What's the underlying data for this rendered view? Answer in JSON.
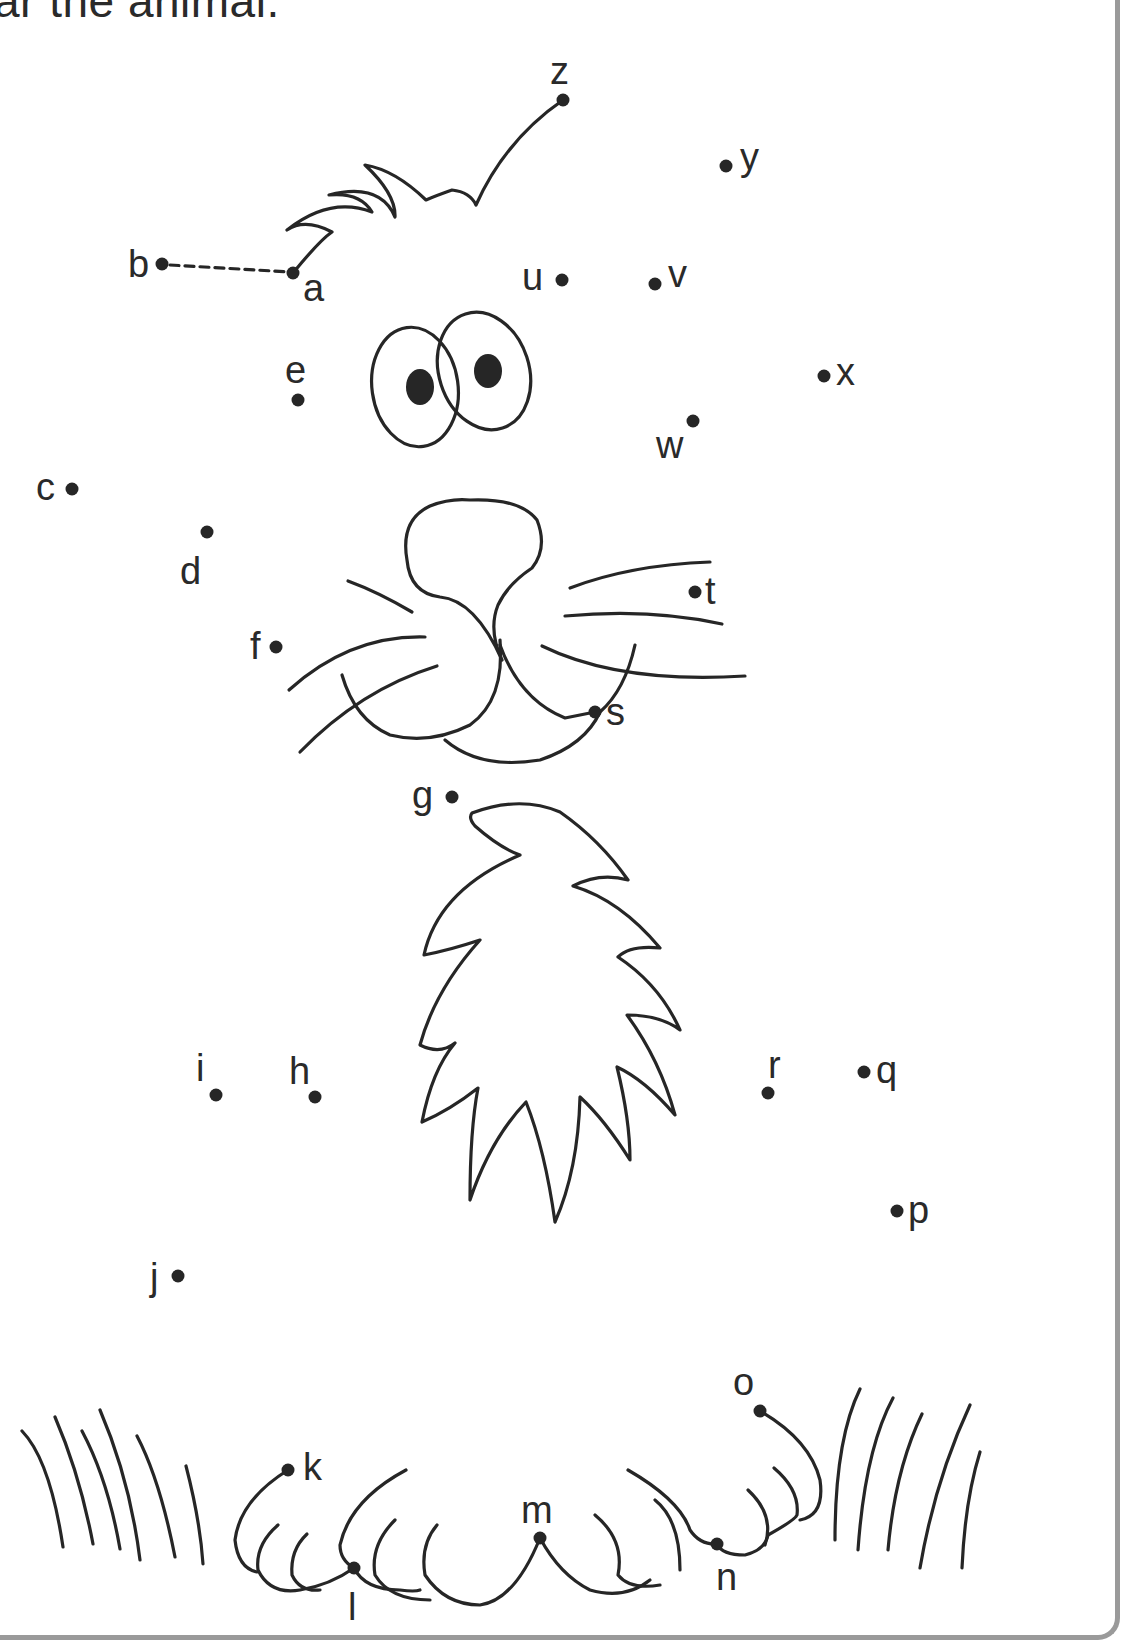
{
  "worksheet": {
    "title_partial": "ar the animal.",
    "instruction_visible": "ar the animal.",
    "sequence_start": "a",
    "sequence_end": "z",
    "guide_segment": {
      "from": "b",
      "to": "a",
      "style": "dashed"
    }
  },
  "dots": [
    {
      "label": "a",
      "x": 293,
      "y": 273
    },
    {
      "label": "b",
      "x": 162,
      "y": 264
    },
    {
      "label": "c",
      "x": 70,
      "y": 489
    },
    {
      "label": "d",
      "x": 207,
      "y": 532
    },
    {
      "label": "e",
      "x": 298,
      "y": 400
    },
    {
      "label": "f",
      "x": 276,
      "y": 647
    },
    {
      "label": "g",
      "x": 452,
      "y": 797
    },
    {
      "label": "h",
      "x": 315,
      "y": 1097
    },
    {
      "label": "i",
      "x": 216,
      "y": 1095
    },
    {
      "label": "j",
      "x": 178,
      "y": 1276
    },
    {
      "label": "k",
      "x": 288,
      "y": 1470
    },
    {
      "label": "l",
      "x": 354,
      "y": 1568
    },
    {
      "label": "m",
      "x": 540,
      "y": 1538
    },
    {
      "label": "n",
      "x": 717,
      "y": 1544
    },
    {
      "label": "o",
      "x": 760,
      "y": 1411
    },
    {
      "label": "p",
      "x": 897,
      "y": 1211
    },
    {
      "label": "q",
      "x": 864,
      "y": 1072
    },
    {
      "label": "r",
      "x": 768,
      "y": 1093
    },
    {
      "label": "s",
      "x": 595,
      "y": 712
    },
    {
      "label": "t",
      "x": 695,
      "y": 592
    },
    {
      "label": "u",
      "x": 562,
      "y": 280
    },
    {
      "label": "v",
      "x": 655,
      "y": 284
    },
    {
      "label": "w",
      "x": 693,
      "y": 421
    },
    {
      "label": "x",
      "x": 824,
      "y": 376
    },
    {
      "label": "y",
      "x": 726,
      "y": 166
    },
    {
      "label": "z",
      "x": 563,
      "y": 100
    }
  ],
  "labels": {
    "a": "a",
    "b": "b",
    "c": "c",
    "d": "d",
    "e": "e",
    "f": "f",
    "g": "g",
    "h": "h",
    "i": "i",
    "j": "j",
    "k": "k",
    "l": "l",
    "m": "m",
    "n": "n",
    "o": "o",
    "p": "p",
    "q": "q",
    "r": "r",
    "s": "s",
    "t": "t",
    "u": "u",
    "v": "v",
    "w": "w",
    "x": "x",
    "y": "y",
    "z": "z"
  },
  "drawing_parts": [
    "head-tuft",
    "eyes",
    "nose",
    "whiskers",
    "mouth",
    "chest-fur",
    "grass-left",
    "paws",
    "grass-right"
  ],
  "colors": {
    "ink": "#262626",
    "frame": "#9a9a9a",
    "background": "#ffffff"
  }
}
